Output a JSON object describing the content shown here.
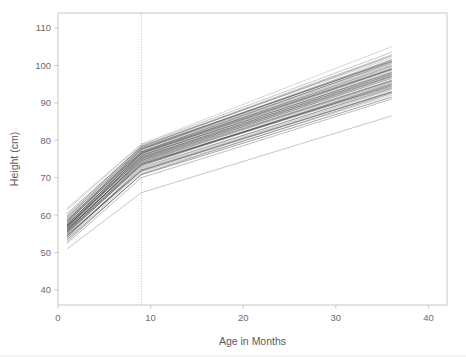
{
  "figure": {
    "background_color": "#ffffff",
    "frame_color": "#b9b9b9",
    "text_color": "#6b6b6b",
    "line_color": "#111111",
    "reference_line_color": "#9a9a9a"
  },
  "axes": {
    "x_title": "Age in Months",
    "y_title": "Height (cm)",
    "x_ticks": [
      "0",
      "10",
      "20",
      "30",
      "40"
    ],
    "y_ticks": [
      "40",
      "50",
      "60",
      "70",
      "80",
      "90",
      "100",
      "110"
    ]
  },
  "annotations": {
    "knot_label": "9"
  },
  "chart_data": {
    "type": "line",
    "title": "",
    "subtitle": "",
    "xlabel": "Age in Months",
    "ylabel": "Height (cm)",
    "xlim": [
      0,
      42
    ],
    "ylim": [
      36,
      114
    ],
    "x_ticks": [
      0,
      10,
      20,
      30,
      40
    ],
    "y_ticks": [
      40,
      50,
      60,
      70,
      80,
      90,
      100,
      110
    ],
    "grid": false,
    "legend": "none",
    "annotations": [
      {
        "kind": "vertical-reference-line",
        "x": 9,
        "style": "dotted",
        "color": "#9a9a9a",
        "note": "knot / breakpoint at 9 months"
      }
    ],
    "x_knots": [
      1,
      9,
      36
    ],
    "series_count": 46,
    "series": [
      {
        "name": "subject-01",
        "x": [
          1,
          9,
          36
        ],
        "values": [
          58.5,
          77.0,
          99.5
        ]
      },
      {
        "name": "subject-02",
        "x": [
          1,
          9,
          36
        ],
        "values": [
          57.0,
          76.0,
          98.0
        ]
      },
      {
        "name": "subject-03",
        "x": [
          1,
          9,
          36
        ],
        "values": [
          56.0,
          75.0,
          97.0
        ]
      },
      {
        "name": "subject-04",
        "x": [
          1,
          9,
          36
        ],
        "values": [
          59.5,
          78.0,
          101.0
        ]
      },
      {
        "name": "subject-05",
        "x": [
          1,
          9,
          36
        ],
        "values": [
          55.0,
          73.5,
          95.0
        ]
      },
      {
        "name": "subject-06",
        "x": [
          1,
          9,
          36
        ],
        "values": [
          54.0,
          72.5,
          94.0
        ]
      },
      {
        "name": "subject-07",
        "x": [
          1,
          9,
          36
        ],
        "values": [
          60.0,
          78.5,
          102.0
        ]
      },
      {
        "name": "subject-08",
        "x": [
          1,
          9,
          36
        ],
        "values": [
          57.5,
          76.5,
          99.0
        ]
      },
      {
        "name": "subject-09",
        "x": [
          1,
          9,
          36
        ],
        "values": [
          56.5,
          74.5,
          96.0
        ]
      },
      {
        "name": "subject-10",
        "x": [
          1,
          9,
          36
        ],
        "values": [
          53.0,
          71.0,
          92.5
        ]
      },
      {
        "name": "subject-11",
        "x": [
          1,
          9,
          36
        ],
        "values": [
          58.0,
          77.5,
          100.5
        ]
      },
      {
        "name": "subject-12",
        "x": [
          1,
          9,
          36
        ],
        "values": [
          55.5,
          74.0,
          95.5
        ]
      },
      {
        "name": "subject-13",
        "x": [
          1,
          9,
          36
        ],
        "values": [
          57.0,
          75.5,
          97.5
        ]
      },
      {
        "name": "subject-14",
        "x": [
          1,
          9,
          36
        ],
        "values": [
          59.0,
          77.0,
          100.0
        ]
      },
      {
        "name": "subject-15",
        "x": [
          1,
          9,
          36
        ],
        "values": [
          54.5,
          72.0,
          93.0
        ]
      },
      {
        "name": "subject-16",
        "x": [
          1,
          9,
          36
        ],
        "values": [
          56.0,
          74.8,
          96.5
        ]
      },
      {
        "name": "subject-17",
        "x": [
          1,
          9,
          36
        ],
        "values": [
          58.2,
          76.8,
          99.2
        ]
      },
      {
        "name": "subject-18",
        "x": [
          1,
          9,
          36
        ],
        "values": [
          52.5,
          70.0,
          91.0
        ]
      },
      {
        "name": "subject-19",
        "x": [
          1,
          9,
          36
        ],
        "values": [
          61.5,
          78.8,
          103.5
        ]
      },
      {
        "name": "subject-20",
        "x": [
          1,
          9,
          36
        ],
        "values": [
          57.8,
          76.2,
          98.5
        ]
      },
      {
        "name": "subject-21",
        "x": [
          1,
          9,
          36
        ],
        "values": [
          55.8,
          73.8,
          94.5
        ]
      },
      {
        "name": "subject-22",
        "x": [
          1,
          9,
          36
        ],
        "values": [
          56.8,
          75.2,
          97.2
        ]
      },
      {
        "name": "subject-23",
        "x": [
          1,
          9,
          36
        ],
        "values": [
          59.2,
          77.8,
          101.5
        ]
      },
      {
        "name": "subject-24",
        "x": [
          1,
          9,
          36
        ],
        "values": [
          54.2,
          72.8,
          93.8
        ]
      },
      {
        "name": "subject-25",
        "x": [
          1,
          9,
          36
        ],
        "values": [
          57.2,
          75.8,
          98.2
        ]
      },
      {
        "name": "subject-26",
        "x": [
          1,
          9,
          36
        ],
        "values": [
          53.8,
          71.5,
          92.0
        ]
      },
      {
        "name": "subject-27",
        "x": [
          1,
          9,
          36
        ],
        "values": [
          58.8,
          77.2,
          100.2
        ]
      },
      {
        "name": "subject-28",
        "x": [
          1,
          9,
          36
        ],
        "values": [
          56.2,
          74.2,
          95.8
        ]
      },
      {
        "name": "subject-29",
        "x": [
          1,
          9,
          36
        ],
        "values": [
          55.2,
          73.2,
          94.8
        ]
      },
      {
        "name": "subject-30",
        "x": [
          1,
          9,
          36
        ],
        "values": [
          60.5,
          78.2,
          102.5
        ]
      },
      {
        "name": "subject-31",
        "x": [
          1,
          9,
          36
        ],
        "values": [
          57.4,
          76.4,
          98.8
        ]
      },
      {
        "name": "subject-32",
        "x": [
          1,
          9,
          36
        ],
        "values": [
          54.8,
          72.2,
          93.5
        ]
      },
      {
        "name": "subject-33",
        "x": [
          1,
          9,
          36
        ],
        "values": [
          56.6,
          75.6,
          97.8
        ]
      },
      {
        "name": "subject-34",
        "x": [
          1,
          9,
          36
        ],
        "values": [
          58.6,
          77.6,
          101.2
        ]
      },
      {
        "name": "subject-35",
        "x": [
          1,
          9,
          36
        ],
        "values": [
          53.5,
          70.8,
          91.5
        ]
      },
      {
        "name": "subject-36",
        "x": [
          1,
          9,
          36
        ],
        "values": [
          57.6,
          76.6,
          99.8
        ]
      },
      {
        "name": "subject-37",
        "x": [
          1,
          9,
          36
        ],
        "values": [
          55.4,
          73.4,
          95.2
        ]
      },
      {
        "name": "subject-38",
        "x": [
          1,
          9,
          36
        ],
        "values": [
          59.8,
          78.4,
          102.8
        ]
      },
      {
        "name": "subject-39",
        "x": [
          1,
          9,
          36
        ],
        "values": [
          56.4,
          74.6,
          96.8
        ]
      },
      {
        "name": "subject-40",
        "x": [
          1,
          9,
          36
        ],
        "values": [
          62.0,
          79.0,
          105.0
        ]
      },
      {
        "name": "subject-41",
        "x": [
          1,
          9,
          36
        ],
        "values": [
          54.6,
          71.8,
          92.8
        ]
      },
      {
        "name": "subject-42",
        "x": [
          1,
          9,
          36
        ],
        "values": [
          57.1,
          75.4,
          97.6
        ]
      },
      {
        "name": "subject-43",
        "x": [
          1,
          9,
          36
        ],
        "values": [
          58.4,
          76.9,
          100.8
        ]
      },
      {
        "name": "subject-44",
        "x": [
          1,
          9,
          36
        ],
        "values": [
          55.6,
          73.6,
          94.2
        ]
      },
      {
        "name": "subject-45",
        "x": [
          1,
          9,
          36
        ],
        "values": [
          51.0,
          66.0,
          86.5
        ]
      },
      {
        "name": "subject-46",
        "x": [
          1,
          9,
          36
        ],
        "values": [
          56.9,
          75.9,
          98.9
        ]
      }
    ]
  }
}
